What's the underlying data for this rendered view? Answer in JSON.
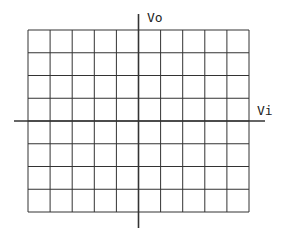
{
  "diagram": {
    "type": "transfer-characteristic-grid",
    "axes": {
      "x_label": "Vi",
      "y_label": "Vo"
    },
    "grid": {
      "columns": 10,
      "rows": 8,
      "left": 28,
      "top": 30,
      "right": 249,
      "bottom": 212
    },
    "x_axis": {
      "y": 121,
      "x_start": 14,
      "x_end": 265
    },
    "y_axis": {
      "x": 138.5,
      "y_start": 14,
      "y_end": 228
    },
    "colors": {
      "line": "#333333",
      "background": "#ffffff"
    }
  }
}
